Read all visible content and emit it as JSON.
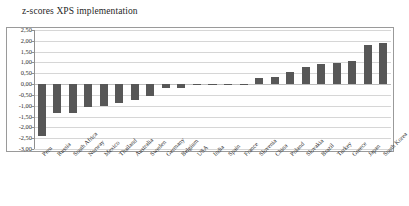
{
  "chart_data": {
    "type": "bar",
    "title": "z-scores XPS implementation",
    "xlabel": "",
    "ylabel": "",
    "ylim": [
      -3.0,
      2.5
    ],
    "ytick_step": 0.5,
    "ytick_labels": [
      "2,50",
      "2,00",
      "1,50",
      "1,00",
      "0,50",
      "0,00",
      "-0,50",
      "-1,00",
      "-1,50",
      "-2,00",
      "-2,50",
      "-3,00"
    ],
    "ytick_values": [
      2.5,
      2.0,
      1.5,
      1.0,
      0.5,
      0.0,
      -0.5,
      -1.0,
      -1.5,
      -2.0,
      -2.5,
      -3.0
    ],
    "grid": true,
    "legend": false,
    "legend_position": "none",
    "bar_color": "#575757",
    "gridline_color": "#d6d6d6",
    "categories": [
      "Peru",
      "Russia",
      "South Africa",
      "Norway",
      "Mexico",
      "Thailand",
      "Australia",
      "Sweden",
      "Germany",
      "Belgium",
      "USA",
      "India",
      "Spain",
      "France",
      "Slovenia",
      "China",
      "Poland",
      "Slovakia",
      "Brazil",
      "Turkey",
      "Greece",
      "Japan",
      "South Korea"
    ],
    "values": [
      -2.38,
      -1.33,
      -1.33,
      -1.06,
      -1.02,
      -0.88,
      -0.75,
      -0.56,
      -0.2,
      -0.18,
      -0.05,
      -0.03,
      -0.02,
      -0.02,
      0.3,
      0.34,
      0.56,
      0.78,
      0.92,
      0.97,
      1.06,
      1.8,
      1.89
    ]
  }
}
